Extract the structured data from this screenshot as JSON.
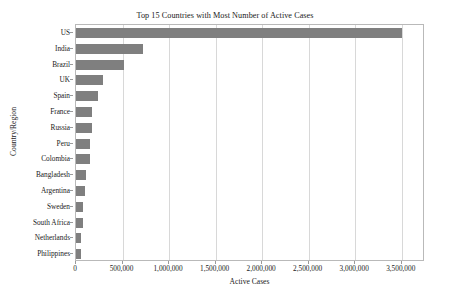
{
  "chart_data": {
    "type": "bar",
    "orientation": "horizontal",
    "title": "Top 15 Countries with Most Number of Active Cases",
    "xlabel": "Active Cases",
    "ylabel": "Country/Region",
    "categories": [
      "US",
      "India",
      "Brazil",
      "UK",
      "Spain",
      "France",
      "Russia",
      "Peru",
      "Colombia",
      "Bangladesh",
      "Argentina",
      "Sweden",
      "South Africa",
      "Netherlands",
      "Philippines"
    ],
    "values": [
      3500000,
      720000,
      520000,
      290000,
      240000,
      172000,
      170000,
      155000,
      150000,
      110000,
      92000,
      75000,
      72000,
      52000,
      50000
    ],
    "xlim": [
      0,
      3750000
    ],
    "xticks": [
      0,
      500000,
      1000000,
      1500000,
      2000000,
      2500000,
      3000000,
      3500000
    ],
    "xtick_labels": [
      "0",
      "500,000",
      "1,000,000",
      "1,500,000",
      "2,000,000",
      "2,500,000",
      "3,000,000",
      "3,500,000"
    ],
    "grid": "vertical",
    "legend": "none",
    "bar_color": "#7f7f7f",
    "grid_color": "#d8d8d8",
    "axes_color": "#b9b9b9",
    "background_color": "#ffffff"
  }
}
